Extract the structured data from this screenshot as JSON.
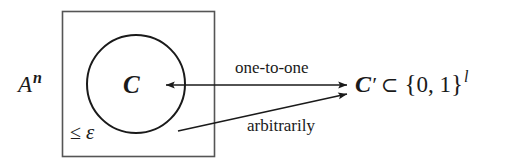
{
  "figure": {
    "type": "diagram",
    "background_color": "#ffffff",
    "stroke_color": "#1a1a1a",
    "labels": {
      "ambient_set": {
        "base": "A",
        "superscript": "n"
      },
      "code_set": "C",
      "distance_bound": {
        "relation": "≤",
        "symbol": "ε"
      },
      "arrow_top": "one-to-one",
      "arrow_bottom": "arbitrarily",
      "image_set": {
        "name": "C",
        "prime": "′",
        "subset": "⊂",
        "open_brace": "{",
        "bits": "0, 1",
        "close_brace": "}",
        "superscript": "l"
      }
    },
    "shapes": {
      "rectangle": {
        "x": 62,
        "y": 11,
        "width": 152,
        "height": 145
      },
      "circle": {
        "cx": 136,
        "cy": 84,
        "r": 49
      },
      "arrow_top": {
        "x1": 348,
        "y1": 85,
        "x2": 165,
        "y2": 85,
        "heads": "both"
      },
      "arrow_bottom": {
        "x1": 178,
        "y1": 131,
        "x2": 348,
        "y2": 94,
        "heads": "end"
      }
    }
  }
}
